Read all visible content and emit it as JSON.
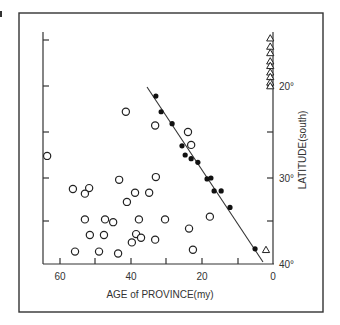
{
  "chart_data": {
    "type": "scatter",
    "title": "",
    "xlabel": "AGE of PROVINCE(my)",
    "ylabel": "LATITUDE(south)",
    "xlim": [
      65,
      0
    ],
    "ylim": [
      40,
      13
    ],
    "x_reversed": true,
    "y_axis_position": "right",
    "x_ticks": [
      60,
      50,
      40,
      30,
      20,
      10,
      0
    ],
    "x_tick_labels": [
      "60",
      "",
      "40",
      "",
      "20",
      "",
      "0"
    ],
    "y_ticks": [
      15,
      20,
      25,
      30,
      35,
      40
    ],
    "y_tick_labels": [
      "",
      "20°",
      "",
      "30°",
      "",
      "40°"
    ],
    "grid": false,
    "legend": null,
    "series": [
      {
        "name": "filled-dots",
        "marker": "filled-circle",
        "points": [
          [
            32.9,
            21.1
          ],
          [
            31.4,
            22.8
          ],
          [
            28.3,
            24.1
          ],
          [
            25.5,
            26.5
          ],
          [
            24.6,
            27.5
          ],
          [
            22.9,
            27.9
          ],
          [
            21.0,
            28.3
          ],
          [
            18.4,
            30.1
          ],
          [
            17.3,
            30.0
          ],
          [
            16.4,
            31.4
          ],
          [
            14.4,
            31.4
          ],
          [
            11.9,
            33.2
          ],
          [
            4.8,
            37.7
          ]
        ]
      },
      {
        "name": "open-circles",
        "marker": "open-circle",
        "points": [
          [
            63.7,
            27.6
          ],
          [
            41.4,
            22.8
          ],
          [
            33.1,
            24.3
          ],
          [
            23.8,
            25.0
          ],
          [
            22.9,
            26.4
          ],
          [
            56.4,
            31.2
          ],
          [
            51.8,
            31.1
          ],
          [
            53.0,
            31.7
          ],
          [
            43.3,
            30.2
          ],
          [
            32.9,
            29.9
          ],
          [
            38.8,
            31.6
          ],
          [
            34.8,
            31.6
          ],
          [
            41.1,
            32.6
          ],
          [
            53.0,
            34.5
          ],
          [
            47.3,
            34.5
          ],
          [
            45.0,
            34.8
          ],
          [
            37.7,
            34.5
          ],
          [
            30.3,
            34.5
          ],
          [
            17.6,
            34.2
          ],
          [
            51.6,
            36.2
          ],
          [
            47.6,
            36.2
          ],
          [
            38.5,
            36.1
          ],
          [
            37.1,
            36.5
          ],
          [
            39.7,
            37.0
          ],
          [
            33.1,
            36.7
          ],
          [
            23.5,
            35.5
          ],
          [
            55.8,
            38.0
          ],
          [
            49.0,
            38.0
          ],
          [
            43.6,
            38.2
          ],
          [
            22.4,
            37.8
          ]
        ]
      },
      {
        "name": "open-triangles",
        "marker": "open-triangle",
        "points": [
          [
            0.5,
            14.8
          ],
          [
            0.5,
            15.7
          ],
          [
            0.5,
            16.4
          ],
          [
            0.5,
            17.3
          ],
          [
            0.5,
            17.8
          ],
          [
            0.5,
            18.5
          ],
          [
            0.5,
            19.0
          ],
          [
            0.5,
            19.6
          ],
          [
            0.5,
            20.0
          ],
          [
            1.7,
            37.8
          ]
        ]
      }
    ],
    "regression_line": {
      "from": [
        35.5,
        20.1
      ],
      "to": [
        2.5,
        39.1
      ]
    }
  },
  "figure": {
    "x_axis_label": "AGE of PROVINCE(my)",
    "y_axis_label": "LATITUDE(south)",
    "x_labels": [
      "60",
      "40",
      "20",
      "0"
    ],
    "y_labels": [
      "20°",
      "30°",
      "40°"
    ]
  }
}
